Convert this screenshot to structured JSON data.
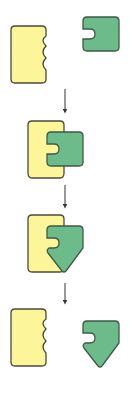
{
  "diagram": {
    "title": "",
    "colors": {
      "yellow_fill": "#fdf59a",
      "green_fill": "#6dbb8a",
      "outline": "#4a4a3a",
      "arrow": "#333333",
      "background": "#ffffff"
    },
    "stages": [
      {
        "id": 1,
        "description": "Yellow wavy-edged block and green notched block, separated"
      },
      {
        "id": 2,
        "description": "Green notched block docked into yellow block's wavy edge"
      },
      {
        "id": 3,
        "description": "Docked green block changes shape into a downward-pointing pentagon"
      },
      {
        "id": 4,
        "description": "Yellow block and reshaped green pentagon block, separated"
      }
    ],
    "arrows": 3
  }
}
